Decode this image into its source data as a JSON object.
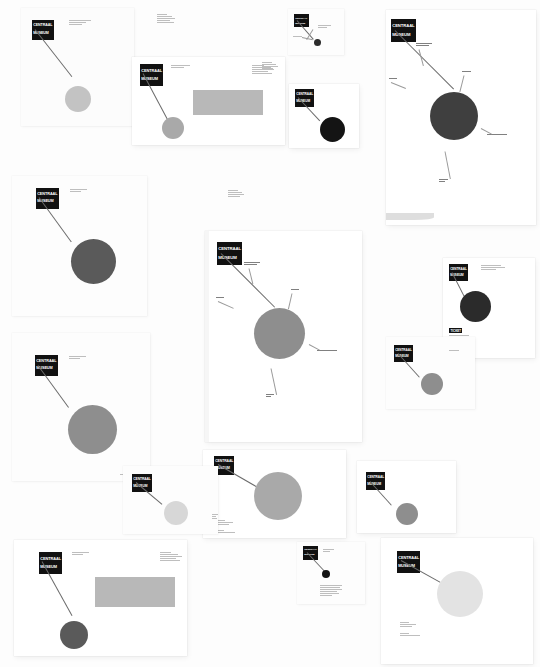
{
  "artboard": {
    "title": "Centraal Museum",
    "background": "#fdfdfd",
    "width": 540,
    "height": 667
  },
  "brand": {
    "logo_line1": "CENTRAAL",
    "logo_line2": "MUSEUM",
    "logo_bg": "#111111",
    "logo_fg": "#ffffff",
    "ticket_label": "TICKET"
  },
  "palette": {
    "dot_black": "#141414",
    "dot_dark": "#2b2b2b",
    "dot_charcoal": "#3f3f3f",
    "dot_mid": "#5a5a5a",
    "dot_grey": "#8e8e8e",
    "dot_silver": "#a9a9a9",
    "dot_light": "#c3c3c3",
    "dot_pale": "#d7d7d7",
    "dot_faint": "#e3e3e3",
    "band_grey": "#b8b8b8",
    "band_light": "#cccccc",
    "sheet_white": "#ffffff",
    "leader_line": "#6b6b6b"
  },
  "pieces": [
    {
      "id": "letterhead-a4-top-left",
      "name": "letterhead-portrait",
      "dot_tone": "dot_light",
      "caption": "Centraal Museum\nAgnietenstraat 1"
    },
    {
      "id": "envelope-top-centre",
      "name": "envelope-window",
      "dot_tone": "dot_silver",
      "band_tone": "band_grey",
      "caption": "Centraal Museum\nPostbus 2106"
    },
    {
      "id": "card-top-centre-small",
      "name": "business-card-small",
      "dot_tone": "dot_dark",
      "caption": "Centraal Museum"
    },
    {
      "id": "card-black-dot",
      "name": "business-card-black-dot",
      "dot_tone": "dot_black",
      "caption": "Centraal Museum"
    },
    {
      "id": "poster-top-right",
      "name": "poster-annotated-dark",
      "dot_tone": "dot_charcoal",
      "annotations": [
        "Collectie",
        "Tentoonstelling",
        "Agenda",
        "Bezoek",
        "Museumkwartier",
        "Educatie"
      ]
    },
    {
      "id": "letterhead-mid-left",
      "name": "letterhead-dark-dot",
      "dot_tone": "dot_mid",
      "caption": "Centraal Museum"
    },
    {
      "id": "letterhead-mid-left-2",
      "name": "letterhead-grey-dot",
      "dot_tone": "dot_grey",
      "caption": "Centraal Museum"
    },
    {
      "id": "poster-centre",
      "name": "poster-annotated-grey",
      "dot_tone": "dot_grey",
      "annotations": [
        "Collectie",
        "Agenda",
        "Bezoek",
        "Tentoonstelling",
        "Educatie"
      ]
    },
    {
      "id": "card-centre-bottom",
      "name": "flyer-grey-dot",
      "dot_tone": "dot_silver",
      "caption": "Centraal Museum\nAgnietenstraat 1\n3512 XA Utrecht"
    },
    {
      "id": "card-left-bottom",
      "name": "card-pale-dot",
      "dot_tone": "dot_pale",
      "caption": "Centraal Museum\nAgnietenstraat 1\n3512 XA Utrecht"
    },
    {
      "id": "ticket-right",
      "name": "ticket-black-dot",
      "dot_tone": "dot_dark",
      "caption": "Centraal Museum\nToegangsbewijs",
      "has_ticket_label": true
    },
    {
      "id": "card-right-mid",
      "name": "card-grey-dot",
      "dot_tone": "dot_grey",
      "caption": "Centraal Museum"
    },
    {
      "id": "card-right-lower",
      "name": "card-grey-dot-2",
      "dot_tone": "dot_grey",
      "caption": "Centraal Museum"
    },
    {
      "id": "envelope-bottom-left",
      "name": "envelope-window-bottom",
      "dot_tone": "dot_mid",
      "band_tone": "band_grey",
      "caption": "Centraal Museum\nPostbus 2106"
    },
    {
      "id": "card-bottom-centre",
      "name": "card-tiny-black-dot",
      "dot_tone": "dot_black",
      "caption": "Centraal Museum"
    },
    {
      "id": "poster-bottom-right",
      "name": "poster-pale-dot",
      "dot_tone": "dot_faint",
      "caption": "Centraal Museum\nAgnietenstraat 1\n3512 XA Utrecht"
    }
  ]
}
